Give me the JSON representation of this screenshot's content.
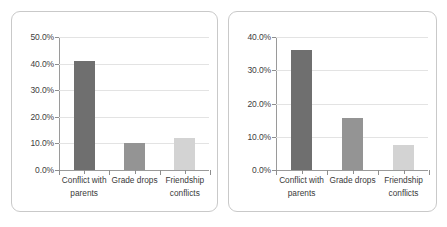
{
  "chart_data": [
    {
      "type": "bar",
      "panel": "left",
      "title": "",
      "xlabel": "",
      "ylabel": "",
      "categories": [
        "Conflict with parents",
        "Grade drops",
        "Friendship conflicts"
      ],
      "category_lines": [
        [
          "Conflict with",
          "parents"
        ],
        [
          "Grade drops",
          ""
        ],
        [
          "Friendship",
          "conflicts"
        ]
      ],
      "values": [
        41.0,
        10.0,
        12.0
      ],
      "value_labels": [
        "41.0%",
        "10.0%",
        "12.0%"
      ],
      "ylim": [
        0,
        50
      ],
      "ytick_values": [
        0,
        10,
        20,
        30,
        40,
        50
      ],
      "ytick_labels": [
        "0.0%",
        "10.0%",
        "20.0%",
        "30.0%",
        "40.0%",
        "50.0%"
      ],
      "bar_colors": [
        "#6f6f6f",
        "#949494",
        "#d3d3d3"
      ],
      "grid": true,
      "legend": "none"
    },
    {
      "type": "bar",
      "panel": "right",
      "title": "",
      "xlabel": "",
      "ylabel": "",
      "categories": [
        "Conflict with parents",
        "Grade drops",
        "Friendship conflicts"
      ],
      "category_lines": [
        [
          "Conflict with",
          "parents"
        ],
        [
          "Grade drops",
          ""
        ],
        [
          "Friendship",
          "conflicts"
        ]
      ],
      "values": [
        36.0,
        15.5,
        7.5
      ],
      "value_labels": [
        "36.0%",
        "15.5%",
        "7.5%"
      ],
      "ylim": [
        0,
        40
      ],
      "ytick_values": [
        0,
        10,
        20,
        30,
        40
      ],
      "ytick_labels": [
        "0.0%",
        "10.0%",
        "20.0%",
        "30.0%",
        "40.0%"
      ],
      "bar_colors": [
        "#6f6f6f",
        "#949494",
        "#d3d3d3"
      ],
      "grid": true,
      "legend": "none"
    }
  ],
  "style": {
    "panel_border_color": "#c9c9c9",
    "gridline_color": "#e3e3e3",
    "axis_color": "#9a9a9a",
    "text_color": "#3b3b3b",
    "background": "#ffffff"
  }
}
